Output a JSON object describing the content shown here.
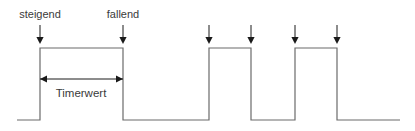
{
  "figure": {
    "background_color": "#ffffff",
    "signal_color": "#6b6b6b",
    "arrow_color": "#1a1a1a",
    "text_color": "#3a3a3a"
  },
  "labels": {
    "rising_edge": "steigend",
    "falling_edge": "fallend",
    "measurement": "Timerwert"
  },
  "chart_data": {
    "type": "line",
    "xlabel": "",
    "ylabel": "",
    "grid": false,
    "legend": "none",
    "series": [
      {
        "name": "Signal",
        "kind": "digital-waveform",
        "levels": {
          "low": 0,
          "high": 1
        },
        "points": [
          {
            "x": 17,
            "y": 0
          },
          {
            "x": 40,
            "y": 0
          },
          {
            "x": 40,
            "y": 1
          },
          {
            "x": 123,
            "y": 1
          },
          {
            "x": 123,
            "y": 0
          },
          {
            "x": 209,
            "y": 0
          },
          {
            "x": 209,
            "y": 1
          },
          {
            "x": 251,
            "y": 1
          },
          {
            "x": 251,
            "y": 0
          },
          {
            "x": 295,
            "y": 0
          },
          {
            "x": 295,
            "y": 1
          },
          {
            "x": 337,
            "y": 1
          },
          {
            "x": 337,
            "y": 0
          },
          {
            "x": 400,
            "y": 0
          }
        ]
      }
    ],
    "annotations": {
      "edge_markers": [
        {
          "id": "marker-1",
          "x": 40,
          "edge": "rising",
          "label": "steigend"
        },
        {
          "id": "marker-2",
          "x": 123,
          "edge": "falling",
          "label": "fallend"
        },
        {
          "id": "marker-3",
          "x": 209,
          "edge": "rising",
          "label": ""
        },
        {
          "id": "marker-4",
          "x": 251,
          "edge": "falling",
          "label": ""
        },
        {
          "id": "marker-5",
          "x": 295,
          "edge": "rising",
          "label": ""
        },
        {
          "id": "marker-6",
          "x": 337,
          "edge": "falling",
          "label": ""
        }
      ],
      "dimension": {
        "id": "timerwert-dimension",
        "label": "Timerwert",
        "from_x": 40,
        "to_x": 123,
        "y": 79,
        "style": "double-headed-arrow"
      }
    },
    "geometry": {
      "baseline_y": 120,
      "high_y": 48,
      "arrow_tip_y": 44,
      "arrow_tail_y": 25
    }
  }
}
